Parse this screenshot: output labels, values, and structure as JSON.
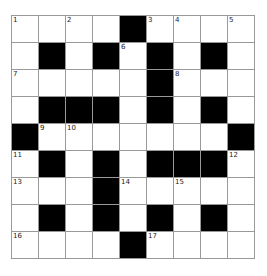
{
  "puzzle": {
    "rows": 9,
    "cols": 9,
    "layout": [
      ".....#....",
      "x"
    ],
    "grid": [
      [
        0,
        0,
        0,
        0,
        1,
        0,
        0,
        0,
        0
      ],
      [
        0,
        1,
        0,
        1,
        0,
        1,
        0,
        1,
        0
      ],
      [
        0,
        0,
        0,
        0,
        0,
        1,
        0,
        0,
        0
      ],
      [
        0,
        1,
        1,
        1,
        0,
        1,
        0,
        1,
        0
      ],
      [
        1,
        0,
        0,
        0,
        0,
        0,
        0,
        0,
        1
      ],
      [
        0,
        1,
        0,
        1,
        0,
        1,
        1,
        1,
        0
      ],
      [
        0,
        0,
        0,
        1,
        0,
        0,
        0,
        0,
        0
      ],
      [
        0,
        1,
        0,
        1,
        0,
        1,
        0,
        1,
        0
      ],
      [
        0,
        0,
        0,
        0,
        1,
        0,
        0,
        0,
        0
      ]
    ],
    "numbers": [
      {
        "r": 0,
        "c": 0,
        "n": "1"
      },
      {
        "r": 0,
        "c": 2,
        "n": "2"
      },
      {
        "r": 0,
        "c": 5,
        "n": "3"
      },
      {
        "r": 0,
        "c": 6,
        "n": "4"
      },
      {
        "r": 0,
        "c": 8,
        "n": "5"
      },
      {
        "r": 1,
        "c": 4,
        "n": "6"
      },
      {
        "r": 2,
        "c": 0,
        "n": "7"
      },
      {
        "r": 2,
        "c": 6,
        "n": "8"
      },
      {
        "r": 4,
        "c": 1,
        "n": "9"
      },
      {
        "r": 4,
        "c": 2,
        "n": "10"
      },
      {
        "r": 5,
        "c": 0,
        "n": "11"
      },
      {
        "r": 5,
        "c": 8,
        "n": "12"
      },
      {
        "r": 6,
        "c": 0,
        "n": "13"
      },
      {
        "r": 6,
        "c": 4,
        "n": "14"
      },
      {
        "r": 6,
        "c": 6,
        "n": "15"
      },
      {
        "r": 8,
        "c": 0,
        "n": "16"
      },
      {
        "r": 8,
        "c": 5,
        "n": "17"
      }
    ],
    "colors": {
      "block": "#000000",
      "cell": "#ffffff",
      "line": "#999999"
    }
  }
}
